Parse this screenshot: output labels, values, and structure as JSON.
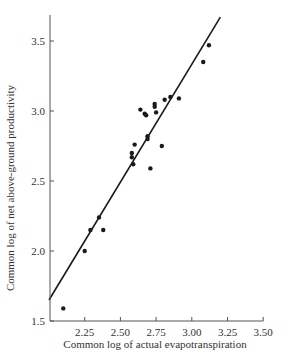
{
  "chart_data": {
    "type": "scatter",
    "title": "",
    "xlabel": "Common log of actual evapotranspiration",
    "ylabel": "Common log of net above-ground productivity",
    "xlim": [
      2.0,
      3.5
    ],
    "ylim": [
      1.5,
      3.7
    ],
    "xticks": [
      2.25,
      2.5,
      2.75,
      3.0,
      3.25,
      3.5
    ],
    "xtick_labels": [
      "2.25",
      "2.50",
      "2.75",
      "3.00",
      "3.25",
      "3.50"
    ],
    "yticks": [
      1.5,
      2.0,
      2.5,
      3.0,
      3.5
    ],
    "ytick_labels": [
      "1.5",
      "2.0",
      "2.5",
      "3.0",
      "3.5"
    ],
    "grid": false,
    "legend": null,
    "series": [
      {
        "name": "observations",
        "points": [
          {
            "x": 2.1,
            "y": 1.59
          },
          {
            "x": 2.25,
            "y": 2.0
          },
          {
            "x": 2.29,
            "y": 2.15
          },
          {
            "x": 2.35,
            "y": 2.24
          },
          {
            "x": 2.38,
            "y": 2.15
          },
          {
            "x": 2.58,
            "y": 2.7
          },
          {
            "x": 2.58,
            "y": 2.67
          },
          {
            "x": 2.59,
            "y": 2.62
          },
          {
            "x": 2.6,
            "y": 2.76
          },
          {
            "x": 2.64,
            "y": 3.01
          },
          {
            "x": 2.67,
            "y": 2.98
          },
          {
            "x": 2.68,
            "y": 2.97
          },
          {
            "x": 2.69,
            "y": 2.82
          },
          {
            "x": 2.69,
            "y": 2.8
          },
          {
            "x": 2.71,
            "y": 2.59
          },
          {
            "x": 2.74,
            "y": 3.05
          },
          {
            "x": 2.74,
            "y": 3.03
          },
          {
            "x": 2.75,
            "y": 2.99
          },
          {
            "x": 2.79,
            "y": 2.75
          },
          {
            "x": 2.81,
            "y": 3.08
          },
          {
            "x": 2.85,
            "y": 3.1
          },
          {
            "x": 2.91,
            "y": 3.09
          },
          {
            "x": 3.08,
            "y": 3.35
          },
          {
            "x": 3.12,
            "y": 3.47
          }
        ]
      },
      {
        "name": "regression line",
        "type": "line",
        "points": [
          {
            "x": 2.0,
            "y": 1.65
          },
          {
            "x": 3.2,
            "y": 3.67
          }
        ]
      }
    ]
  },
  "colors": {
    "ink": "#1a1a1a",
    "axis": "#555555",
    "background": "#ffffff"
  }
}
